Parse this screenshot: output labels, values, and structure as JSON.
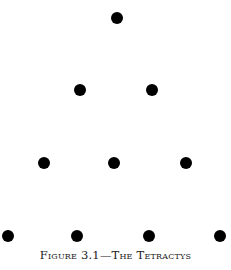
{
  "figure": {
    "caption": "Figure 3.1—The Tetractys",
    "dot_color": "#000000",
    "rows": [
      {
        "count": 1,
        "dots": [
          {
            "x": 117,
            "y": 18
          }
        ]
      },
      {
        "count": 2,
        "dots": [
          {
            "x": 80,
            "y": 90
          },
          {
            "x": 152,
            "y": 90
          }
        ]
      },
      {
        "count": 3,
        "dots": [
          {
            "x": 44,
            "y": 163
          },
          {
            "x": 114,
            "y": 163
          },
          {
            "x": 186,
            "y": 163
          }
        ]
      },
      {
        "count": 4,
        "dots": [
          {
            "x": 8,
            "y": 236
          },
          {
            "x": 77,
            "y": 236
          },
          {
            "x": 149,
            "y": 236
          },
          {
            "x": 220,
            "y": 236
          }
        ]
      }
    ]
  }
}
